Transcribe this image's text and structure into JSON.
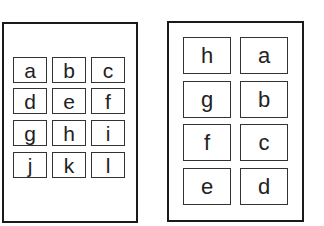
{
  "left_sheet": {
    "layout": "3 columns x 4 rows",
    "cells": [
      "a",
      "b",
      "c",
      "d",
      "e",
      "f",
      "g",
      "h",
      "i",
      "j",
      "k",
      "l"
    ]
  },
  "right_sheet": {
    "layout": "2 columns x 4 rows",
    "cells": [
      "h",
      "a",
      "g",
      "b",
      "f",
      "c",
      "e",
      "d"
    ]
  },
  "colors": {
    "border": "#1a1a1a",
    "cell_border": "#333333",
    "text": "#222222",
    "background": "#ffffff"
  }
}
